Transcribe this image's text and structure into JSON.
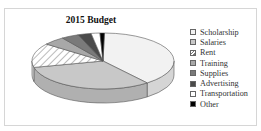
{
  "chart_data": {
    "type": "pie",
    "title": "2015 Budget",
    "style": "3d",
    "categories": [
      "Scholarship",
      "Salaries",
      "Rent",
      "Training",
      "Supplies",
      "Advertising",
      "Transportation",
      "Other"
    ],
    "values": [
      39,
      32,
      14,
      5,
      4,
      3,
      2,
      1
    ],
    "unit": "percent (estimated)",
    "colors": [
      "#f2f2f2",
      "#c8c8c8",
      "hatched",
      "#a8a8a8",
      "#7a7a7a",
      "#4a4a4a",
      "#ffffff",
      "#000000"
    ],
    "legend_position": "right"
  },
  "legend": {
    "items": [
      {
        "label": "Scholarship",
        "color": "#f2f2f2"
      },
      {
        "label": "Salaries",
        "color": "#c8c8c8"
      },
      {
        "label": "Rent",
        "color": "hatched"
      },
      {
        "label": "Training",
        "color": "#a8a8a8"
      },
      {
        "label": "Supplies",
        "color": "#7a7a7a"
      },
      {
        "label": "Advertising",
        "color": "#4a4a4a"
      },
      {
        "label": "Transportation",
        "color": "#ffffff"
      },
      {
        "label": "Other",
        "color": "#000000"
      }
    ]
  }
}
